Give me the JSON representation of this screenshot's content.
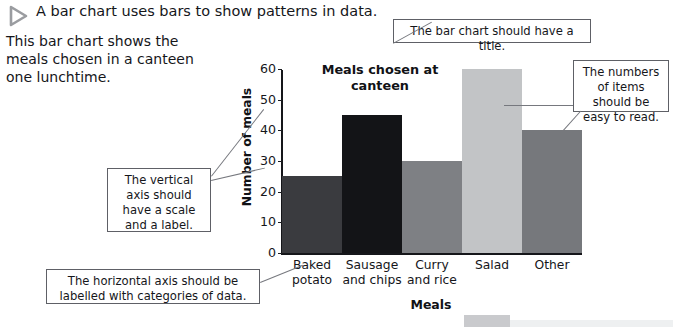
{
  "header": {
    "icon": "play-triangle-icon",
    "text": "A bar chart uses bars to show patterns in data."
  },
  "intro": {
    "text": "This bar chart shows the meals chosen in a canteen one lunchtime."
  },
  "callouts": [
    {
      "id": "title-callout",
      "text": "The bar chart should have a title."
    },
    {
      "id": "numbers-callout",
      "text": "The numbers of items should be easy to read."
    },
    {
      "id": "vertical-callout",
      "text": "The vertical axis should have a scale and a label."
    },
    {
      "id": "horizontal-callout",
      "text": "The horizontal axis should be labelled with categories of data."
    }
  ],
  "chart_data": {
    "type": "bar",
    "title": "Meals chosen at canteen",
    "categories": [
      "Baked potato",
      "Sausage and chips",
      "Curry and rice",
      "Salad",
      "Other"
    ],
    "values": [
      25,
      45,
      30,
      60,
      40
    ],
    "colors": [
      "#3a3b3f",
      "#131417",
      "#7e8084",
      "#c2c4c6",
      "#76787c"
    ],
    "xlabel": "Meals",
    "ylabel": "Number of meals",
    "ylim": [
      0,
      60
    ],
    "yticks": [
      0,
      10,
      20,
      30,
      40,
      50,
      60
    ],
    "grid": false,
    "legend": false
  }
}
